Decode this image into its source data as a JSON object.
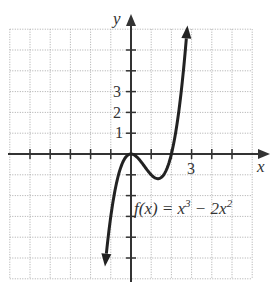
{
  "chart_data": {
    "type": "line",
    "title": "",
    "function_label": "f(x) = x³ − 2x²",
    "xlabel": "x",
    "ylabel": "y",
    "xlim": [
      -6,
      6
    ],
    "ylim": [
      -6,
      6
    ],
    "grid": true,
    "x_tick_labels": [
      {
        "value": 3,
        "label": "3"
      }
    ],
    "y_tick_labels": [
      {
        "value": 1,
        "label": "1"
      },
      {
        "value": 2,
        "label": "2"
      },
      {
        "value": 3,
        "label": "3"
      }
    ],
    "series": [
      {
        "name": "f(x) = x^3 - 2x^2",
        "x": [
          -1.3,
          -1.0,
          -0.5,
          0,
          0.5,
          1.0,
          1.333,
          1.5,
          2.0,
          2.5,
          2.8
        ],
        "y": [
          -5.58,
          -3.0,
          -0.625,
          0,
          -0.375,
          -1.0,
          -1.185,
          -1.125,
          0,
          3.125,
          6.27
        ]
      }
    ]
  },
  "labels": {
    "x_axis": "x",
    "y_axis": "y",
    "tick_x3": "3",
    "tick_y1": "1",
    "tick_y2": "2",
    "tick_y3": "3",
    "fx_f": "f(x) = x",
    "fx_exp1": "3",
    "fx_mid": " − 2x",
    "fx_exp2": "2"
  }
}
